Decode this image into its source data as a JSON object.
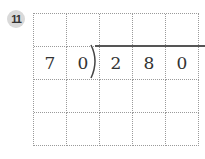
{
  "problem": {
    "number": "11",
    "divisor_digits": [
      "7",
      "0"
    ],
    "dividend_digits": [
      "2",
      "8",
      "0"
    ]
  },
  "grid": {
    "rows": [
      [
        "",
        "",
        "",
        "",
        ""
      ],
      [
        "7",
        "0",
        "2",
        "8",
        "0"
      ],
      [
        "",
        "",
        "",
        "",
        ""
      ],
      [
        "",
        "",
        "",
        "",
        ""
      ]
    ]
  }
}
